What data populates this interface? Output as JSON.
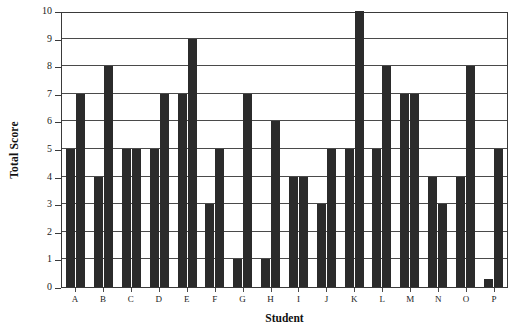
{
  "chart_data": {
    "type": "bar",
    "title": "",
    "xlabel": "Student",
    "ylabel": "Total Score",
    "categories": [
      "A",
      "B",
      "C",
      "D",
      "E",
      "F",
      "G",
      "H",
      "I",
      "J",
      "K",
      "L",
      "M",
      "N",
      "O",
      "P"
    ],
    "series": [
      {
        "name": "Series 1",
        "values": [
          5,
          4,
          5,
          5,
          7,
          3,
          1,
          1,
          4,
          3,
          5,
          5,
          7,
          4,
          4,
          0.3
        ]
      },
      {
        "name": "Series 2",
        "values": [
          7,
          8,
          5,
          7,
          9,
          5,
          7,
          6,
          4,
          5,
          10,
          8,
          7,
          3,
          8,
          5
        ]
      }
    ],
    "ylim": [
      0,
      10
    ],
    "yticks": [
      0,
      1,
      2,
      3,
      4,
      5,
      6,
      7,
      8,
      9,
      10
    ],
    "grid": true,
    "legend": "none",
    "bar_color": "#2b2b2b",
    "axis_color": "#3a3a3a",
    "background": "#ffffff"
  }
}
